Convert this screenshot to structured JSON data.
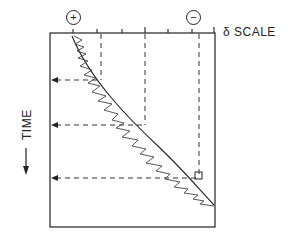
{
  "diagram": {
    "scale_label": "δ SCALE",
    "plus_symbol": "+",
    "minus_symbol": "−",
    "time_label": "TIME",
    "time_arrow": "←"
  }
}
